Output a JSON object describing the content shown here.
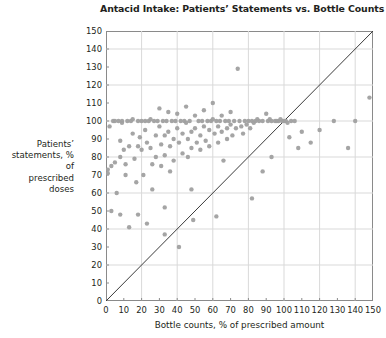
{
  "chart_data": {
    "type": "scatter",
    "title": "Antacid Intake: Patients’ Statements vs. Bottle Counts",
    "xlabel": "Bottle counts, % of prescribed amount",
    "ylabel": "Patients’ statements, % of prescribed doses",
    "ylabel_lines": [
      "Patients’",
      "statements, % of",
      "prescribed doses"
    ],
    "xlim": [
      0,
      150
    ],
    "ylim": [
      0,
      150
    ],
    "xticks": [
      0,
      10,
      20,
      30,
      40,
      50,
      60,
      70,
      80,
      90,
      100,
      110,
      120,
      130,
      140,
      150
    ],
    "yticks": [
      0,
      10,
      20,
      30,
      40,
      50,
      60,
      70,
      80,
      90,
      100,
      110,
      120,
      130,
      140,
      150
    ],
    "grid": true,
    "grid_interval": 20,
    "grid_color": "#d9d9d9",
    "frame_color": "#8a8a8a",
    "legend": null,
    "marker": {
      "shape": "circle",
      "color": "#a0a0a0",
      "size_px": 4.4,
      "opacity": 0.95
    },
    "reference_line": {
      "label": "identity line y = x",
      "from": [
        0,
        0
      ],
      "to": [
        150,
        150
      ],
      "color": "#3a3a3a",
      "width_px": 1
    },
    "series": [
      {
        "name": "patients",
        "points": [
          [
            1,
            73
          ],
          [
            1,
            71
          ],
          [
            2,
            97
          ],
          [
            3,
            75
          ],
          [
            3,
            50
          ],
          [
            4,
            100
          ],
          [
            5,
            100
          ],
          [
            5,
            77
          ],
          [
            6,
            60
          ],
          [
            7,
            100
          ],
          [
            8,
            89
          ],
          [
            8,
            80
          ],
          [
            9,
            100
          ],
          [
            9,
            99
          ],
          [
            10,
            84
          ],
          [
            11,
            76
          ],
          [
            11,
            70
          ],
          [
            12,
            100
          ],
          [
            13,
            86
          ],
          [
            14,
            100
          ],
          [
            15,
            101
          ],
          [
            15,
            93
          ],
          [
            16,
            79
          ],
          [
            17,
            66
          ],
          [
            18,
            100
          ],
          [
            18,
            86
          ],
          [
            19,
            91
          ],
          [
            20,
            100
          ],
          [
            20,
            84
          ],
          [
            21,
            70
          ],
          [
            22,
            100
          ],
          [
            22,
            95
          ],
          [
            23,
            88
          ],
          [
            24,
            100
          ],
          [
            25,
            101
          ],
          [
            25,
            85
          ],
          [
            26,
            76
          ],
          [
            26,
            62
          ],
          [
            27,
            100
          ],
          [
            28,
            92
          ],
          [
            28,
            80
          ],
          [
            29,
            100
          ],
          [
            30,
            107
          ],
          [
            30,
            97
          ],
          [
            31,
            87
          ],
          [
            31,
            75
          ],
          [
            32,
            100
          ],
          [
            33,
            92
          ],
          [
            33,
            81
          ],
          [
            34,
            100
          ],
          [
            35,
            105
          ],
          [
            35,
            94
          ],
          [
            36,
            86
          ],
          [
            36,
            72
          ],
          [
            37,
            100
          ],
          [
            38,
            90
          ],
          [
            38,
            78
          ],
          [
            39,
            100
          ],
          [
            40,
            104
          ],
          [
            40,
            96
          ],
          [
            41,
            88
          ],
          [
            41,
            30
          ],
          [
            42,
            100
          ],
          [
            43,
            93
          ],
          [
            43,
            82
          ],
          [
            44,
            100
          ],
          [
            45,
            108
          ],
          [
            45,
            99
          ],
          [
            46,
            90
          ],
          [
            46,
            80
          ],
          [
            47,
            100
          ],
          [
            48,
            94
          ],
          [
            48,
            85
          ],
          [
            49,
            45
          ],
          [
            50,
            103
          ],
          [
            50,
            96
          ],
          [
            51,
            88
          ],
          [
            52,
            100
          ],
          [
            53,
            92
          ],
          [
            53,
            84
          ],
          [
            54,
            100
          ],
          [
            55,
            106
          ],
          [
            55,
            97
          ],
          [
            56,
            89
          ],
          [
            57,
            100
          ],
          [
            58,
            95
          ],
          [
            58,
            86
          ],
          [
            59,
            100
          ],
          [
            60,
            110
          ],
          [
            60,
            101
          ],
          [
            61,
            93
          ],
          [
            62,
            100
          ],
          [
            63,
            97
          ],
          [
            63,
            88
          ],
          [
            64,
            100
          ],
          [
            65,
            103
          ],
          [
            65,
            94
          ],
          [
            66,
            78
          ],
          [
            67,
            100
          ],
          [
            68,
            96
          ],
          [
            68,
            90
          ],
          [
            69,
            100
          ],
          [
            70,
            105
          ],
          [
            70,
            98
          ],
          [
            71,
            92
          ],
          [
            72,
            100
          ],
          [
            73,
            96
          ],
          [
            74,
            129
          ],
          [
            75,
            100
          ],
          [
            76,
            97
          ],
          [
            77,
            93
          ],
          [
            78,
            100
          ],
          [
            79,
            98
          ],
          [
            80,
            100
          ],
          [
            81,
            96
          ],
          [
            82,
            100
          ],
          [
            83,
            99
          ],
          [
            84,
            100
          ],
          [
            85,
            101
          ],
          [
            86,
            100
          ],
          [
            88,
            100
          ],
          [
            90,
            104
          ],
          [
            91,
            100
          ],
          [
            92,
            101
          ],
          [
            93,
            100
          ],
          [
            95,
            100
          ],
          [
            96,
            100
          ],
          [
            97,
            100
          ],
          [
            98,
            101
          ],
          [
            99,
            100
          ],
          [
            100,
            100
          ],
          [
            101,
            100
          ],
          [
            102,
            99
          ],
          [
            104,
            100
          ],
          [
            106,
            100
          ],
          [
            62,
            47
          ],
          [
            48,
            62
          ],
          [
            33,
            52
          ],
          [
            18,
            48
          ],
          [
            8,
            48
          ],
          [
            23,
            43
          ],
          [
            13,
            41
          ],
          [
            33,
            37
          ],
          [
            88,
            72
          ],
          [
            93,
            80
          ],
          [
            82,
            57
          ],
          [
            103,
            91
          ],
          [
            110,
            94
          ],
          [
            120,
            95
          ],
          [
            128,
            100
          ],
          [
            140,
            100
          ],
          [
            148,
            113
          ],
          [
            136,
            85
          ],
          [
            115,
            88
          ],
          [
            108,
            85
          ]
        ]
      }
    ]
  }
}
